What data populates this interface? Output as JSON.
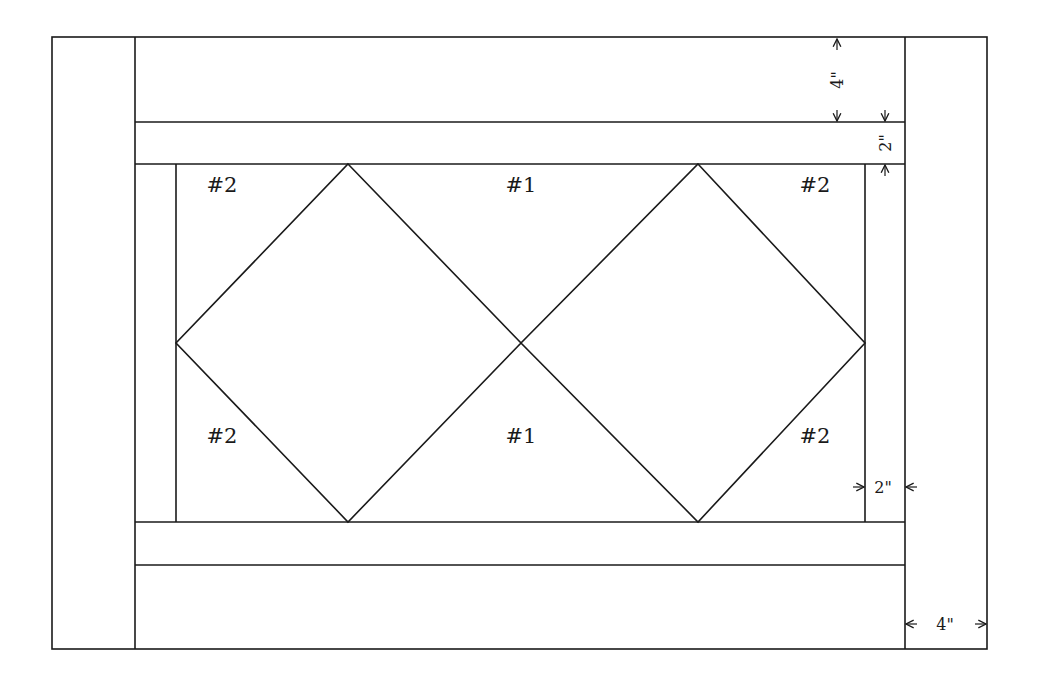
{
  "diagram": {
    "type": "quilt-block-layout",
    "stroke_color": "#1a1a1a",
    "background": "#ffffff",
    "pieces": {
      "top_labels": [
        "#2",
        "#1",
        "#2"
      ],
      "bottom_labels": [
        "#2",
        "#1",
        "#2"
      ]
    },
    "dimensions": {
      "top_border": "4\"",
      "top_inner_strip": "2\"",
      "right_inner_strip": "2\"",
      "right_border": "4\""
    }
  }
}
